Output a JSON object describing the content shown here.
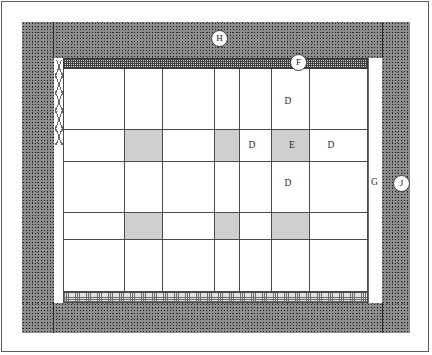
{
  "figure": {
    "width": 432,
    "height": 355
  },
  "callouts": [
    {
      "id": "H",
      "label": "H",
      "x": 211,
      "y": 30,
      "circled": true,
      "desc": "outer-wall"
    },
    {
      "id": "F",
      "label": "F",
      "x": 290,
      "y": 54,
      "circled": true,
      "desc": "top-lintel-band"
    },
    {
      "id": "J",
      "label": "J",
      "x": 396,
      "y": 176,
      "circled": true,
      "desc": "right-outer-wall"
    },
    {
      "id": "G",
      "label": "G",
      "x": 371,
      "y": 178,
      "circled": false,
      "desc": "right-clear-strip"
    }
  ],
  "cell_labels": [
    {
      "label": "D",
      "col": 6,
      "row": 1,
      "x": 288,
      "y": 101
    },
    {
      "label": "D",
      "col": 5,
      "row": 2,
      "x": 252,
      "y": 145
    },
    {
      "label": "E",
      "col": 6,
      "row": 2,
      "x": 292,
      "y": 145
    },
    {
      "label": "D",
      "col": 7,
      "row": 2,
      "x": 331,
      "y": 145
    },
    {
      "label": "D",
      "col": 6,
      "row": 3,
      "x": 288,
      "y": 183
    }
  ],
  "legend_keys": [
    "D",
    "E",
    "F",
    "G",
    "H",
    "J"
  ],
  "colors": {
    "wall_stipple": "#8e8e8e",
    "band_dark_hatch": "#cfcfcf",
    "band_light_hatch": "#e0e0e0",
    "grid_line": "#4a4a4a",
    "shaded_cell": "#cfcfcf",
    "cell_fill": "#ffffff",
    "frame_border": "#5d5d5d",
    "text": "#2b2b2b"
  },
  "regions": {
    "outer_wall": "stipple-masonry",
    "top_band": "fine-crosshatch-dark",
    "bottom_band": "fine-crosshatch-light",
    "hatched_block": "diagonal-hatch",
    "left_strip": "chain-zigzag",
    "right_strip": "plain-white"
  },
  "grid": {
    "columns": 7,
    "rows": 5,
    "col_x": [
      63,
      125,
      163,
      215,
      240,
      272,
      310,
      355
    ],
    "row_y": [
      62,
      130,
      162,
      213,
      240,
      303
    ],
    "shaded_cells": [
      {
        "col": 2,
        "row": 2
      },
      {
        "col": 4,
        "row": 2
      },
      {
        "col": 6,
        "row": 2
      },
      {
        "col": 2,
        "row": 4
      },
      {
        "col": 4,
        "row": 4
      },
      {
        "col": 6,
        "row": 4
      }
    ]
  }
}
